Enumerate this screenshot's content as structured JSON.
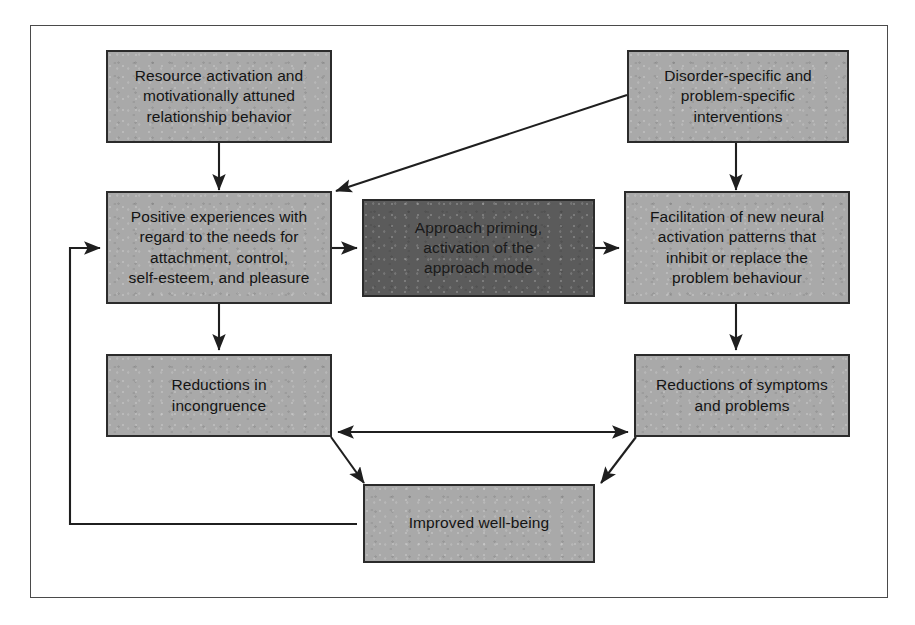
{
  "diagram": {
    "colors": {
      "box_fill_light": "#a9a9a9",
      "box_fill_dark": "#5b5b5b",
      "box_border": "#2b2b2b",
      "frame_border": "#4a4a4a",
      "connector": "#1f1f1f",
      "page_background": "#ffffff",
      "text": "#141414"
    },
    "nodes": [
      {
        "id": "resource-activation",
        "text": "Resource activation and\nmotivationally attuned\nrelationship behavior",
        "style": "light"
      },
      {
        "id": "disorder-specific-interventions",
        "text": "Disorder-specific and\nproblem-specific\ninterventions",
        "style": "light"
      },
      {
        "id": "positive-experiences",
        "text": "Positive experiences with\nregard to the needs for\nattachment, control,\nself-esteem, and pleasure",
        "style": "light"
      },
      {
        "id": "approach-priming",
        "text": "Approach priming,\nactivation of the\napproach mode",
        "style": "dark"
      },
      {
        "id": "neural-activation-patterns",
        "text": "Facilitation of new neural\nactivation patterns that\ninhibit or replace the\nproblem behaviour",
        "style": "light"
      },
      {
        "id": "reductions-in-incongruence",
        "text": "Reductions in\nincongruence",
        "style": "light"
      },
      {
        "id": "reductions-of-symptoms",
        "text": "Reductions of symptoms\nand problems",
        "style": "light"
      },
      {
        "id": "improved-well-being",
        "text": "Improved well-being",
        "style": "light"
      }
    ],
    "connections": [
      {
        "id": "resource-to-positive",
        "from": "resource-activation",
        "to": "positive-experiences",
        "arrowheads": "single"
      },
      {
        "id": "disorder-to-positive",
        "from": "disorder-specific-interventions",
        "to": "positive-experiences",
        "arrowheads": "single"
      },
      {
        "id": "disorder-to-neural",
        "from": "disorder-specific-interventions",
        "to": "neural-activation-patterns",
        "arrowheads": "single"
      },
      {
        "id": "positive-to-approach",
        "from": "positive-experiences",
        "to": "approach-priming",
        "arrowheads": "single"
      },
      {
        "id": "approach-to-neural",
        "from": "approach-priming",
        "to": "neural-activation-patterns",
        "arrowheads": "single"
      },
      {
        "id": "positive-to-incongruence",
        "from": "positive-experiences",
        "to": "reductions-in-incongruence",
        "arrowheads": "single"
      },
      {
        "id": "neural-to-symptoms",
        "from": "neural-activation-patterns",
        "to": "reductions-of-symptoms",
        "arrowheads": "single"
      },
      {
        "id": "incongruence-symptoms-bidirectional",
        "from": "reductions-in-incongruence",
        "to": "reductions-of-symptoms",
        "arrowheads": "double"
      },
      {
        "id": "incongruence-to-wellbeing",
        "from": "reductions-in-incongruence",
        "to": "improved-well-being",
        "arrowheads": "single"
      },
      {
        "id": "symptoms-to-wellbeing",
        "from": "reductions-of-symptoms",
        "to": "improved-well-being",
        "arrowheads": "single"
      },
      {
        "id": "wellbeing-feedback-to-positive",
        "from": "improved-well-being",
        "to": "positive-experiences",
        "arrowheads": "single"
      }
    ]
  }
}
